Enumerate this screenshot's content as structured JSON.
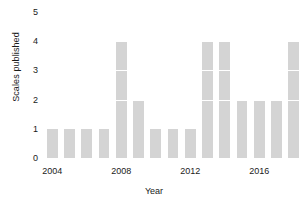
{
  "chart_data": {
    "type": "bar",
    "title": "",
    "xlabel": "Year",
    "ylabel": "Scales published",
    "categories": [
      2004,
      2005,
      2006,
      2007,
      2008,
      2009,
      2010,
      2011,
      2012,
      2013,
      2014,
      2015,
      2016,
      2017,
      2018
    ],
    "values": [
      1,
      1,
      1,
      1,
      4,
      2,
      1,
      1,
      1,
      4,
      4,
      2,
      2,
      2,
      4
    ],
    "ylim": [
      0,
      5
    ],
    "yticks": [
      0,
      1,
      2,
      3,
      4,
      5
    ],
    "ytick_labels": [
      "0",
      "1",
      "2",
      "3",
      "4",
      "5"
    ],
    "xticks": [
      2004,
      2008,
      2012,
      2016
    ],
    "xtick_labels": [
      "2004",
      "2008",
      "2012",
      "2016"
    ],
    "xlim": [
      2003.4,
      2018.6
    ],
    "grid": false,
    "legend": null,
    "bar_color": "#d4d4d4",
    "segment_divider_color": "#ffffff",
    "text_color": "#1a1a1a",
    "background": "#ffffff"
  }
}
